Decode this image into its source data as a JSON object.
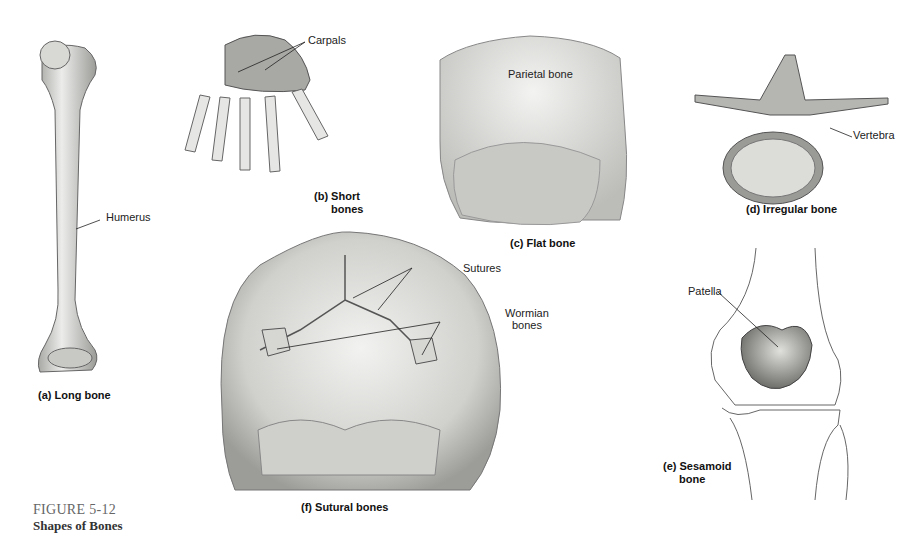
{
  "figure": {
    "number": "FIGURE 5-12",
    "title": "Shapes of Bones"
  },
  "panels": [
    {
      "id": "a",
      "caption": "(a) Long bone",
      "labels": [
        "Humerus"
      ]
    },
    {
      "id": "b",
      "caption_line1": "(b) Short",
      "caption_line2": "bones",
      "labels": [
        "Carpals"
      ]
    },
    {
      "id": "c",
      "caption": "(c) Flat bone",
      "labels": [
        "Parietal bone"
      ]
    },
    {
      "id": "d",
      "caption": "(d) Irregular bone",
      "labels": [
        "Vertebra"
      ]
    },
    {
      "id": "e",
      "caption_line1": "(e) Sesamoid",
      "caption_line2": "bone",
      "labels": [
        "Patella"
      ]
    },
    {
      "id": "f",
      "caption": "(f) Sutural bones",
      "labels": [
        "Sutures",
        "Wormian",
        "bones"
      ]
    }
  ],
  "colors": {
    "background": "#ffffff",
    "bone_light": "#e8e8e6",
    "bone_mid": "#b8b8b5",
    "bone_dark": "#7a7a78",
    "line": "#333333"
  }
}
